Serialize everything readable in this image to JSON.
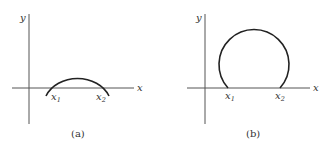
{
  "panels": [
    {
      "id": "a",
      "caption": "(a)",
      "y_label": "y",
      "x_label": "x",
      "point_labels": [
        {
          "base": "x",
          "sub": "1"
        },
        {
          "base": "x",
          "sub": "2"
        }
      ],
      "curve": "shallow arc crossing x-axis at x1 and x2"
    },
    {
      "id": "b",
      "caption": "(b)",
      "y_label": "y",
      "x_label": "x",
      "point_labels": [
        {
          "base": "x",
          "sub": "1"
        },
        {
          "base": "x",
          "sub": "2"
        }
      ],
      "curve": "large circular arc (more than a semicircle) meeting x-axis at x1 and x2"
    }
  ]
}
